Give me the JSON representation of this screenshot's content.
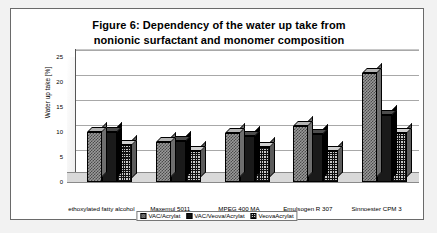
{
  "figure": {
    "title_line1": "Figure 6: Dependency of the water up take from",
    "title_line2": "nonionic surfactant and monomer composition"
  },
  "chart_data": {
    "type": "bar",
    "title": "Figure 6: Dependency of the water up take from nonionic surfactant and monomer composition",
    "xlabel": "",
    "ylabel": "Water up take [%]",
    "ylim": [
      0,
      25
    ],
    "yticks": [
      0,
      5,
      10,
      15,
      20,
      25
    ],
    "grid": true,
    "legend_position": "bottom",
    "style": "3d-grouped-bar",
    "categories": [
      "ethoxylated fatty alcohol",
      "Maxemul 5011",
      "MPEG 400 MA",
      "Emulsogen R 307",
      "Sinnoester CPM 3"
    ],
    "series": [
      {
        "name": "VAC/Acrylat",
        "values": [
          10.0,
          8.0,
          9.8,
          11.2,
          21.8
        ]
      },
      {
        "name": "VAC/Veova/Acrylat",
        "values": [
          10.0,
          8.2,
          9.2,
          9.7,
          13.5
        ]
      },
      {
        "name": "VeovaAcrylat",
        "values": [
          7.5,
          6.2,
          7.0,
          6.2,
          9.8
        ]
      }
    ]
  }
}
